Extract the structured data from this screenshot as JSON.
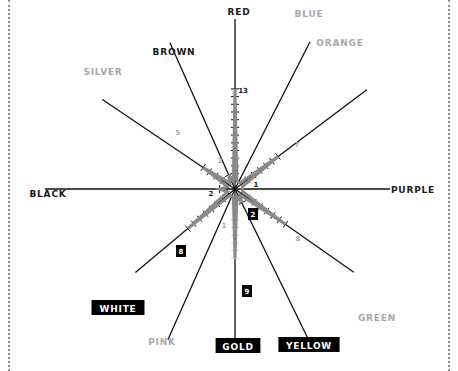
{
  "chart_data": {
    "type": "radar",
    "title": "",
    "center": [
      235,
      189
    ],
    "px_per_unit": 7.7,
    "series": [
      {
        "name": "count",
        "color": "#8a8a8a",
        "values": [
          13,
          1,
          7,
          1,
          8,
          2,
          9,
          1,
          8,
          2,
          5,
          2
        ]
      }
    ],
    "categories": [
      "RED",
      "BLUE",
      "ORANGE",
      "PURPLE",
      "GREEN",
      "YELLOW",
      "GOLD",
      "PINK",
      "WHITE",
      "BLACK",
      "SILVER",
      "BROWN"
    ],
    "angles_deg": [
      90,
      63,
      37,
      0,
      -35,
      -64,
      -90,
      -114,
      -140,
      180,
      146,
      114
    ],
    "label_styles": [
      "dark",
      "light",
      "light",
      "dark",
      "light",
      "boxed",
      "boxed",
      "light",
      "boxed",
      "dark",
      "light",
      "dark"
    ],
    "value_labels": [
      {
        "category": "RED",
        "text": "13",
        "style": "dark"
      },
      {
        "category": "ORANGE",
        "text": "7",
        "style": "light"
      },
      {
        "category": "PURPLE",
        "text": "1",
        "style": "dark"
      },
      {
        "category": "GREEN",
        "text": "8",
        "style": "light"
      },
      {
        "category": "YELLOW",
        "text": "2",
        "style": "boxed"
      },
      {
        "category": "GOLD",
        "text": "9",
        "style": "boxed"
      },
      {
        "category": "PINK",
        "text": "1",
        "style": "light"
      },
      {
        "category": "WHITE",
        "text": "8",
        "style": "boxed"
      },
      {
        "category": "BLACK",
        "text": "2",
        "style": "dark"
      },
      {
        "category": "SILVER",
        "text": "5",
        "style": "light"
      },
      {
        "category": "BROWN",
        "text": "2",
        "style": "light"
      }
    ],
    "grid": false,
    "legend": null
  },
  "colors": {
    "dark_text": "#1a1a1a",
    "light_text": "#a8a8a8",
    "star_outline": "#8a8a8a",
    "spoke": "#111111",
    "box_bg": "#000000",
    "box_text": "#ffffff"
  }
}
